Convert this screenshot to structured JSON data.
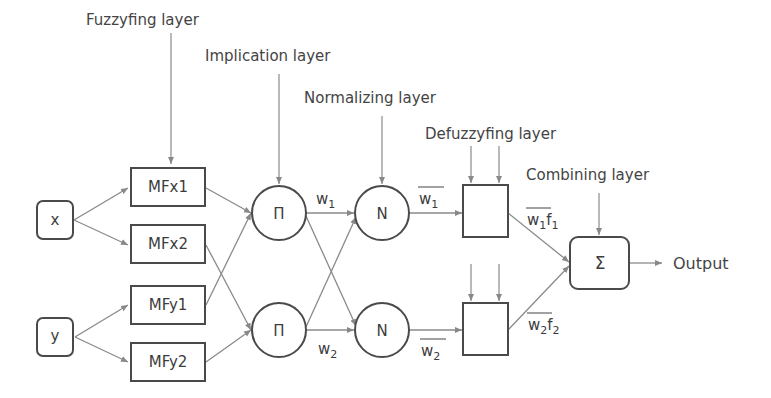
{
  "diagram": {
    "type": "ANFIS architecture",
    "layers": [
      {
        "id": "fuzzyfying",
        "label": "Fuzzyfing layer"
      },
      {
        "id": "implication",
        "label": "Implication layer"
      },
      {
        "id": "normalizing",
        "label": "Normalizing layer"
      },
      {
        "id": "defuzzyfying",
        "label": "Defuzzyfing layer"
      },
      {
        "id": "combining",
        "label": "Combining layer"
      }
    ],
    "inputs": [
      {
        "id": "x",
        "label": "x"
      },
      {
        "id": "y",
        "label": "y"
      }
    ],
    "membership_functions": [
      {
        "id": "mfx1",
        "label": "MFx1"
      },
      {
        "id": "mfx2",
        "label": "MFx2"
      },
      {
        "id": "mfy1",
        "label": "MFy1"
      },
      {
        "id": "mfy2",
        "label": "MFy2"
      }
    ],
    "product_nodes": [
      {
        "id": "pi1",
        "label": "Π"
      },
      {
        "id": "pi2",
        "label": "Π"
      }
    ],
    "normalize_nodes": [
      {
        "id": "n1",
        "label": "N"
      },
      {
        "id": "n2",
        "label": "N"
      }
    ],
    "edge_labels": {
      "w1": {
        "base": "w",
        "sub": "1"
      },
      "w2": {
        "base": "w",
        "sub": "2"
      },
      "w1bar": {
        "base": "w",
        "sub": "1"
      },
      "w2bar": {
        "base": "w",
        "sub": "2"
      },
      "w1f1": {
        "base": "w",
        "sub": "1",
        "f": "f",
        "fsub": "1"
      },
      "w2f2": {
        "base": "w",
        "sub": "2",
        "f": "f",
        "fsub": "2"
      }
    },
    "sum_node": {
      "id": "sigma",
      "label": "Σ"
    },
    "output": {
      "label": "Output"
    },
    "colors": {
      "stroke": "#4a4a4a",
      "arrow": "#8a8a8a",
      "text": "#444444"
    }
  }
}
